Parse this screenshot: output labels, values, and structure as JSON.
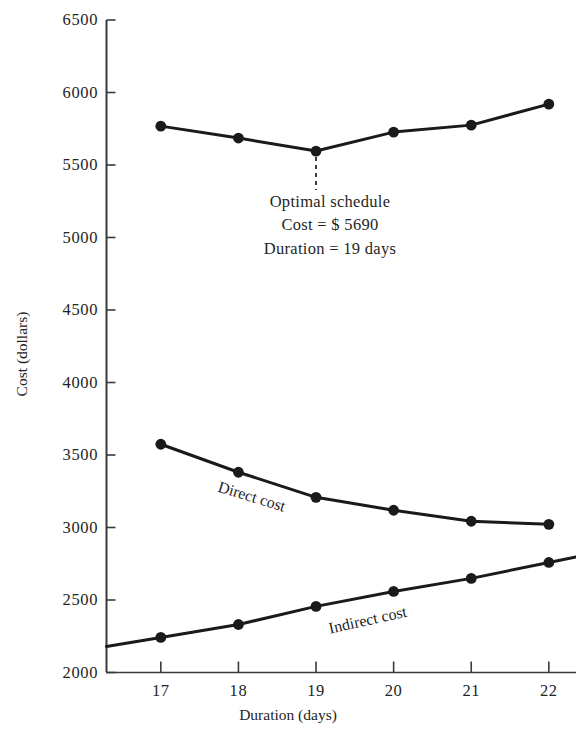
{
  "chart_data": {
    "type": "line",
    "title": "",
    "xlabel": "Duration (days)",
    "ylabel": "Cost (dollars)",
    "x": [
      17,
      18,
      19,
      20,
      21,
      22
    ],
    "xtick_labels": [
      "17",
      "18",
      "19",
      "20",
      "21",
      "22"
    ],
    "ytick_labels": [
      "2000",
      "2500",
      "3000",
      "3500",
      "4000",
      "4500",
      "5000",
      "5500",
      "6000",
      "6500"
    ],
    "ytick_values": [
      2000,
      2500,
      3000,
      3500,
      4000,
      4500,
      5000,
      5500,
      6000,
      6500
    ],
    "xlim": [
      16.3,
      22.35
    ],
    "ylim": [
      2000,
      6500
    ],
    "grid": false,
    "legend_position": "inline-labels",
    "series": [
      {
        "name": "Total cost",
        "label_shown": "",
        "values": [
          5768,
          5686,
          5596,
          5727,
          5775,
          5920
        ],
        "markers": true
      },
      {
        "name": "Direct cost",
        "label_shown": "Direct cost",
        "values": [
          3574,
          3381,
          3208,
          3119,
          3043,
          3022
        ],
        "markers": true
      },
      {
        "name": "Indirect cost",
        "label_shown": "Indirect cost",
        "values": [
          2242,
          2331,
          2456,
          2559,
          2649,
          2759
        ],
        "markers": true
      }
    ],
    "annotations": [
      {
        "name": "optimal-schedule",
        "line1": "Optimal schedule",
        "line2": "Cost = $ 5690",
        "line3": "Duration = 19 days",
        "points_to_x": 19,
        "points_to_y": 5596
      }
    ],
    "colors": {
      "line": "#1a1a1a",
      "axis": "#3a3a3a",
      "text": "#242424",
      "background": "#ffffff"
    }
  },
  "axes": {
    "y_title": "Cost (dollars)",
    "x_title": "Duration (days)"
  },
  "series_labels": {
    "direct": "Direct cost",
    "indirect": "Indirect cost"
  },
  "annotation": {
    "line1": "Optimal schedule",
    "line2": "Cost = $ 5690",
    "line3": "Duration = 19 days"
  }
}
